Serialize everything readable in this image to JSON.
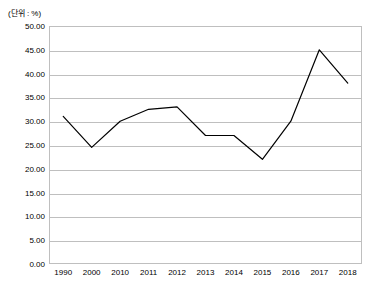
{
  "chart": {
    "unit_label": "(단위 : %)",
    "axis_color": "#bfbfbf",
    "line_color": "#000000"
  },
  "chart_data": {
    "type": "line",
    "title": "",
    "subtitle": "",
    "xlabel": "",
    "ylabel": "",
    "unit": "(단위 : %)",
    "categories": [
      "1990",
      "2000",
      "2010",
      "2011",
      "2012",
      "2013",
      "2014",
      "2015",
      "2016",
      "2017",
      "2018"
    ],
    "series": [
      {
        "name": "",
        "values": [
          31.0,
          24.5,
          30.0,
          32.5,
          33.0,
          27.0,
          27.0,
          22.0,
          30.0,
          45.0,
          38.0
        ]
      }
    ],
    "ylim": [
      0,
      50
    ],
    "ytick_labels": [
      "0.00",
      "5.00",
      "10.00",
      "15.00",
      "20.00",
      "25.00",
      "30.00",
      "35.00",
      "40.00",
      "45.00",
      "50.00"
    ],
    "ytick_values": [
      0,
      5,
      10,
      15,
      20,
      25,
      30,
      35,
      40,
      45,
      50
    ],
    "grid": true,
    "grid_axis": "y",
    "legend": false,
    "legend_position": "none",
    "markers": false
  }
}
